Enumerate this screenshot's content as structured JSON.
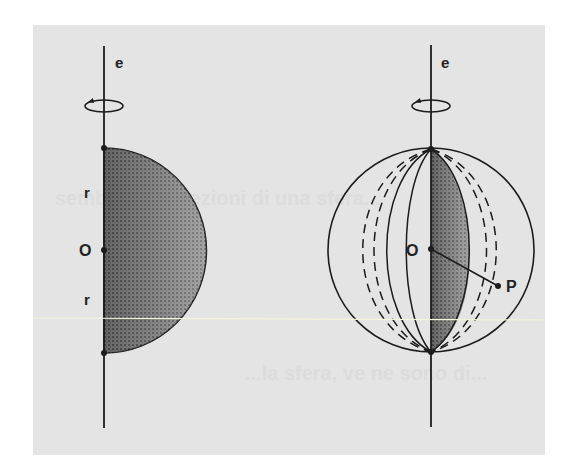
{
  "figure": {
    "background_color": "#e4e4e4",
    "ink_color": "#1c1c1c",
    "left_diagram": {
      "description": "Semicircle (half-disk) rotating about axis e",
      "axis_label": "e",
      "center_label": "O",
      "radius_label_top": "r",
      "radius_label_bottom": "r",
      "rotation_icon": "rotation-arrow-icon"
    },
    "right_diagram": {
      "description": "Sphere generated by rotating the half-disk about axis e",
      "axis_label": "e",
      "center_label": "O",
      "point_label": "P",
      "rotation_icon": "rotation-arrow-icon"
    },
    "bleed_through_text": [
      "sembrano le sezioni di una sfera...",
      "...la sfera, ve ne sono di..."
    ]
  }
}
